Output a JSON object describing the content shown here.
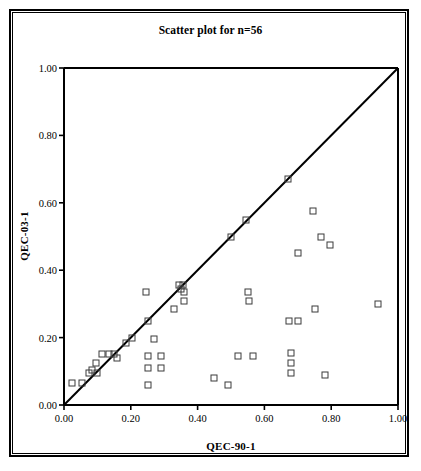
{
  "figure": {
    "title": "Scatter plot for n=56",
    "frame_color": "#000000",
    "background": "#ffffff"
  },
  "axes": {
    "x": {
      "label": "QEC-90-1",
      "ticks": [
        "0.00",
        "0.20",
        "0.40",
        "0.60",
        "0.80",
        "1.00"
      ],
      "tick_values": [
        0.0,
        0.2,
        0.4,
        0.6,
        0.8,
        1.0
      ],
      "min": 0.0,
      "max": 1.0
    },
    "y": {
      "label": "QEC-03-1",
      "ticks": [
        "0.00",
        "0.20",
        "0.40",
        "0.60",
        "0.80",
        "1.00"
      ],
      "tick_values": [
        0.0,
        0.2,
        0.4,
        0.6,
        0.8,
        1.0
      ],
      "min": 0.0,
      "max": 1.0
    }
  },
  "reference_line": {
    "name": "identity-line",
    "description": "y = x diagonal",
    "from": [
      0.0,
      0.0
    ],
    "to": [
      1.0,
      1.0
    ],
    "color": "#000000",
    "width": 2
  },
  "chart_data": {
    "type": "scatter",
    "title": "Scatter plot for n=56",
    "xlabel": "QEC-90-1",
    "ylabel": "QEC-03-1",
    "xlim": [
      0.0,
      1.0
    ],
    "ylim": [
      0.0,
      1.0
    ],
    "xticks": [
      0.0,
      0.2,
      0.4,
      0.6,
      0.8,
      1.0
    ],
    "yticks": [
      0.0,
      0.2,
      0.4,
      0.6,
      0.8,
      1.0
    ],
    "grid": false,
    "legend": null,
    "n": 56,
    "marker": "open-square",
    "marker_color": "#3a3a3a",
    "reference_line": "y=x",
    "points": [
      [
        0.025,
        0.065
      ],
      [
        0.055,
        0.065
      ],
      [
        0.075,
        0.095
      ],
      [
        0.085,
        0.105
      ],
      [
        0.095,
        0.125
      ],
      [
        0.1,
        0.095
      ],
      [
        0.115,
        0.15
      ],
      [
        0.135,
        0.15
      ],
      [
        0.15,
        0.15
      ],
      [
        0.16,
        0.14
      ],
      [
        0.185,
        0.185
      ],
      [
        0.205,
        0.2
      ],
      [
        0.245,
        0.335
      ],
      [
        0.25,
        0.25
      ],
      [
        0.25,
        0.145
      ],
      [
        0.25,
        0.11
      ],
      [
        0.25,
        0.06
      ],
      [
        0.27,
        0.195
      ],
      [
        0.29,
        0.145
      ],
      [
        0.29,
        0.11
      ],
      [
        0.33,
        0.285
      ],
      [
        0.345,
        0.355
      ],
      [
        0.35,
        0.345
      ],
      [
        0.355,
        0.355
      ],
      [
        0.36,
        0.335
      ],
      [
        0.36,
        0.31
      ],
      [
        0.45,
        0.08
      ],
      [
        0.49,
        0.06
      ],
      [
        0.5,
        0.5
      ],
      [
        0.52,
        0.145
      ],
      [
        0.545,
        0.55
      ],
      [
        0.55,
        0.335
      ],
      [
        0.555,
        0.31
      ],
      [
        0.565,
        0.145
      ],
      [
        0.67,
        0.67
      ],
      [
        0.675,
        0.25
      ],
      [
        0.68,
        0.155
      ],
      [
        0.68,
        0.125
      ],
      [
        0.68,
        0.095
      ],
      [
        0.7,
        0.45
      ],
      [
        0.7,
        0.25
      ],
      [
        0.745,
        0.575
      ],
      [
        0.75,
        0.285
      ],
      [
        0.77,
        0.5
      ],
      [
        0.78,
        0.09
      ],
      [
        0.795,
        0.475
      ],
      [
        0.94,
        0.3
      ]
    ]
  }
}
